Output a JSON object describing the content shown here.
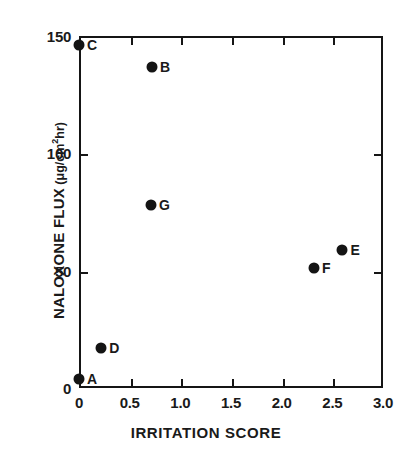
{
  "chart_data": {
    "type": "scatter",
    "title": "",
    "xlabel": "IRRITATION SCORE",
    "ylabel": "NALOXONE FLUX",
    "ylabel_unit_prefix": "(μg/cm",
    "ylabel_unit_sup": "2",
    "ylabel_unit_suffix": "hr)",
    "xlim": [
      0,
      3.0
    ],
    "ylim": [
      0,
      150
    ],
    "xticks": [
      "0",
      "0.5",
      "1.0",
      "1.5",
      "2.0",
      "2.5",
      "3.0"
    ],
    "xtick_values": [
      0,
      0.5,
      1.0,
      1.5,
      2.0,
      2.5,
      3.0
    ],
    "yticks": [
      "0",
      "50",
      "100",
      "150"
    ],
    "ytick_values": [
      0,
      50,
      100,
      150
    ],
    "grid": false,
    "legend": "none",
    "marker_color": "#141414",
    "axis_color": "#151515",
    "background": "#ffffff",
    "points": [
      {
        "label": "A",
        "x": 0.0,
        "y": 4
      },
      {
        "label": "B",
        "x": 0.72,
        "y": 137
      },
      {
        "label": "C",
        "x": 0.0,
        "y": 146
      },
      {
        "label": "D",
        "x": 0.22,
        "y": 17
      },
      {
        "label": "E",
        "x": 2.6,
        "y": 59
      },
      {
        "label": "F",
        "x": 2.32,
        "y": 51
      },
      {
        "label": "G",
        "x": 0.71,
        "y": 78
      }
    ]
  }
}
